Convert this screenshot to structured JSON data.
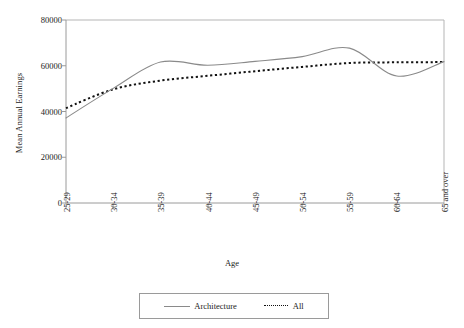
{
  "chart_data": {
    "type": "line",
    "title": "",
    "xlabel": "Age",
    "ylabel": "Mean Annual Earnings",
    "categories": [
      "25-29",
      "30-34",
      "35-39",
      "40-44",
      "45-49",
      "50-54",
      "55-59",
      "60-64",
      "65 and over"
    ],
    "yticks": [
      "0",
      "20000",
      "40000",
      "60000",
      "80000"
    ],
    "ylim": [
      0,
      80000
    ],
    "grid": false,
    "legend_position": "bottom",
    "series": [
      {
        "name": "Architecture",
        "style": "solid",
        "color": "#8a8a8a",
        "values": [
          37200,
          50100,
          61600,
          60200,
          61900,
          64000,
          67700,
          55500,
          61800
        ]
      },
      {
        "name": "All",
        "style": "dotted",
        "color": "#111111",
        "values": [
          41500,
          49700,
          53500,
          55600,
          57600,
          59500,
          61200,
          61500,
          61600
        ]
      }
    ]
  },
  "axis": {
    "y_title": "Mean Annual Earnings",
    "x_title": "Age",
    "y_ticks": [
      {
        "label": "80000",
        "value": 80000
      },
      {
        "label": "60000",
        "value": 60000
      },
      {
        "label": "40000",
        "value": 40000
      },
      {
        "label": "20000",
        "value": 20000
      },
      {
        "label": "0",
        "value": 0
      }
    ],
    "x_ticks": [
      {
        "label": "25-29"
      },
      {
        "label": "30-34"
      },
      {
        "label": "35-39"
      },
      {
        "label": "40-44"
      },
      {
        "label": "45-49"
      },
      {
        "label": "50-54"
      },
      {
        "label": "55-59"
      },
      {
        "label": "60-64"
      },
      {
        "label": "65 and over"
      }
    ]
  },
  "legend": {
    "items": [
      {
        "label": "Architecture",
        "style": "solid"
      },
      {
        "label": "All",
        "style": "dotted"
      }
    ]
  },
  "colors": {
    "architecture_line": "#8a8a8a",
    "all_line": "#111111",
    "axis": "#9a9a9a",
    "text": "#1a1a1a"
  }
}
